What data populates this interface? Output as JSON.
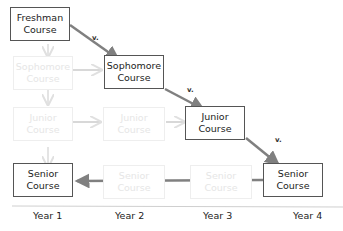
{
  "diagram": {
    "title": "",
    "boxes": [
      {
        "id": "freshman",
        "line1": "Freshman",
        "line2": "Course",
        "state": "active"
      },
      {
        "id": "sophomore-active",
        "line1": "Sophomore",
        "line2": "Course",
        "state": "active"
      },
      {
        "id": "junior-active",
        "line1": "Junior",
        "line2": "Course",
        "state": "active"
      },
      {
        "id": "senior-year4",
        "line1": "Senior",
        "line2": "Course",
        "state": "active"
      },
      {
        "id": "senior-year1",
        "line1": "Senior",
        "line2": "Course",
        "state": "active"
      },
      {
        "id": "sophomore-faded-y1",
        "line1": "Sophomore",
        "line2": "Course",
        "state": "faded"
      },
      {
        "id": "junior-faded-y1",
        "line1": "Junior",
        "line2": "Course",
        "state": "faded"
      },
      {
        "id": "junior-faded-y2",
        "line1": "Junior",
        "line2": "Course",
        "state": "faded"
      },
      {
        "id": "senior-faded-y2",
        "line1": "Senior",
        "line2": "Course",
        "state": "faded"
      },
      {
        "id": "senior-faded-y3",
        "line1": "Senior",
        "line2": "Course",
        "state": "faded"
      }
    ],
    "edge_labels": [
      "v.",
      "v.",
      "v."
    ],
    "axis": {
      "years": [
        "Year 1",
        "Year 2",
        "Year 3",
        "Year 4"
      ]
    },
    "colors": {
      "active_arrow": "#808080",
      "faded_arrow": "#e8e8e8",
      "box_border": "#555555"
    }
  }
}
